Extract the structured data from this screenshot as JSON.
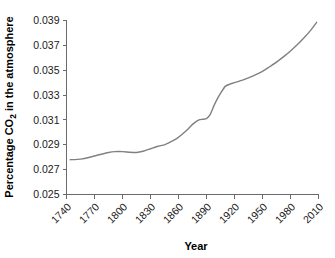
{
  "chart_data": {
    "type": "line",
    "title": "",
    "xlabel": "Year",
    "ylabel": "Percentage CO2 in the atmosphere",
    "ylabel_parts": {
      "pre": "Percentage CO",
      "sub": "2",
      "post": " in the atmosphere"
    },
    "xlim": [
      1740,
      2010
    ],
    "ylim": [
      0.025,
      0.039
    ],
    "grid": false,
    "legend": false,
    "legend_position": "none",
    "line_color": "#808080",
    "axis_color": "#6b6b6b",
    "background_color": "#ffffff",
    "xticks": [
      1740,
      1770,
      1800,
      1830,
      1860,
      1890,
      1920,
      1950,
      1980,
      2010
    ],
    "xtick_labels": [
      "1740",
      "1770",
      "1800",
      "1830",
      "1860",
      "1890",
      "1920",
      "1950",
      "1980",
      "2010"
    ],
    "xtick_rotation": 45,
    "yticks": [
      0.025,
      0.027,
      0.029,
      0.031,
      0.033,
      0.035,
      0.037,
      0.039
    ],
    "ytick_labels": [
      "0.025",
      "0.027",
      "0.029",
      "0.031",
      "0.033",
      "0.035",
      "0.037",
      "0.039"
    ],
    "series": [
      {
        "name": "Percentage CO2 in the atmosphere",
        "x": [
          1744,
          1755,
          1765,
          1775,
          1785,
          1792,
          1800,
          1808,
          1815,
          1822,
          1830,
          1838,
          1845,
          1852,
          1858,
          1864,
          1870,
          1876,
          1882,
          1886,
          1890,
          1894,
          1898,
          1902,
          1906,
          1910,
          1915,
          1920,
          1930,
          1940,
          1950,
          1958,
          1965,
          1972,
          1980,
          1988,
          1995,
          2002,
          2008
        ],
        "y": [
          0.0278,
          0.02785,
          0.028,
          0.0282,
          0.02838,
          0.02845,
          0.02845,
          0.0284,
          0.02838,
          0.02848,
          0.02868,
          0.02888,
          0.029,
          0.02925,
          0.0295,
          0.02985,
          0.03025,
          0.0307,
          0.031,
          0.03105,
          0.0311,
          0.03145,
          0.03215,
          0.03275,
          0.03325,
          0.0337,
          0.03388,
          0.034,
          0.03425,
          0.03455,
          0.0349,
          0.0353,
          0.03565,
          0.03605,
          0.03655,
          0.0371,
          0.03765,
          0.03825,
          0.03885
        ]
      }
    ]
  }
}
